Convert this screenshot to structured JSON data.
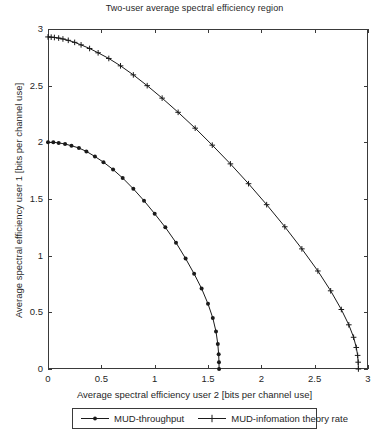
{
  "chart_data": {
    "type": "line",
    "title": "Two-user average spectral efficiency region",
    "xlabel": "Average spectral efficiency user 2 [bits per channel use]",
    "ylabel": "Average spectral efficiency user 1 [bits per channel use]",
    "xlim": [
      0,
      3
    ],
    "ylim": [
      0,
      3
    ],
    "xticks": [
      "0",
      "0.5",
      "1",
      "1.5",
      "2",
      "2.5",
      "3"
    ],
    "xtick_values": [
      0,
      0.5,
      1,
      1.5,
      2,
      2.5,
      3
    ],
    "yticks": [
      "0",
      "0.5",
      "1",
      "1.5",
      "2",
      "2.5",
      "3"
    ],
    "ytick_values": [
      0,
      0.5,
      1,
      1.5,
      2,
      2.5,
      3
    ],
    "grid": false,
    "legend_position": "below-axes",
    "series": [
      {
        "name": "MUD-throughput",
        "marker": "dot",
        "color": "#1a1a1a",
        "points": [
          [
            0.0,
            2.0
          ],
          [
            0.05,
            2.0
          ],
          [
            0.1,
            1.995
          ],
          [
            0.16,
            1.985
          ],
          [
            0.22,
            1.97
          ],
          [
            0.29,
            1.95
          ],
          [
            0.36,
            1.92
          ],
          [
            0.44,
            1.875
          ],
          [
            0.52,
            1.825
          ],
          [
            0.61,
            1.76
          ],
          [
            0.7,
            1.685
          ],
          [
            0.8,
            1.59
          ],
          [
            0.9,
            1.485
          ],
          [
            1.0,
            1.37
          ],
          [
            1.1,
            1.25
          ],
          [
            1.2,
            1.115
          ],
          [
            1.29,
            0.975
          ],
          [
            1.37,
            0.84
          ],
          [
            1.44,
            0.71
          ],
          [
            1.5,
            0.575
          ],
          [
            1.545,
            0.45
          ],
          [
            1.575,
            0.33
          ],
          [
            1.592,
            0.22
          ],
          [
            1.6,
            0.13
          ],
          [
            1.603,
            0.06
          ],
          [
            1.604,
            0.0
          ]
        ]
      },
      {
        "name": "MUD-infomation theory rate",
        "marker": "plus",
        "color": "#1a1a1a",
        "points": [
          [
            0.0,
            2.93
          ],
          [
            0.03,
            2.928
          ],
          [
            0.06,
            2.925
          ],
          [
            0.1,
            2.92
          ],
          [
            0.14,
            2.912
          ],
          [
            0.19,
            2.9
          ],
          [
            0.25,
            2.882
          ],
          [
            0.31,
            2.86
          ],
          [
            0.39,
            2.828
          ],
          [
            0.47,
            2.79
          ],
          [
            0.57,
            2.74
          ],
          [
            0.68,
            2.675
          ],
          [
            0.8,
            2.595
          ],
          [
            0.93,
            2.5
          ],
          [
            1.07,
            2.39
          ],
          [
            1.22,
            2.265
          ],
          [
            1.38,
            2.125
          ],
          [
            1.54,
            1.975
          ],
          [
            1.71,
            1.81
          ],
          [
            1.88,
            1.635
          ],
          [
            2.05,
            1.45
          ],
          [
            2.22,
            1.255
          ],
          [
            2.38,
            1.06
          ],
          [
            2.53,
            0.865
          ],
          [
            2.65,
            0.69
          ],
          [
            2.75,
            0.525
          ],
          [
            2.82,
            0.39
          ],
          [
            2.865,
            0.28
          ],
          [
            2.89,
            0.19
          ],
          [
            2.903,
            0.12
          ],
          [
            2.908,
            0.06
          ],
          [
            2.91,
            0.0
          ]
        ]
      }
    ]
  },
  "legend": {
    "entries": [
      {
        "label": "MUD-throughput"
      },
      {
        "label": "MUD-infomation theory rate"
      }
    ]
  },
  "colors": {
    "axis": "#3a3a3a",
    "line": "#1a1a1a",
    "background": "#ffffff"
  }
}
